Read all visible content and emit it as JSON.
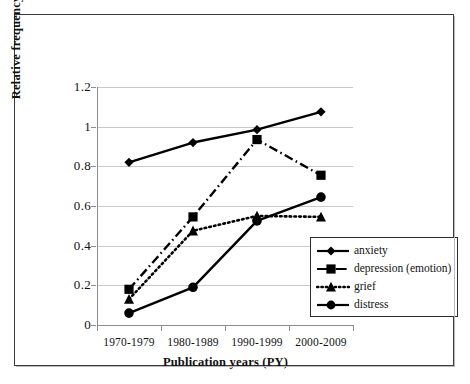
{
  "chart_data": {
    "type": "line",
    "title": "",
    "xlabel": "Publication years (PY)",
    "ylabel": "Relative frequency (%)",
    "categories": [
      "1970-1979",
      "1980-1989",
      "1990-1999",
      "2000-2009"
    ],
    "ylim": [
      0,
      1.2
    ],
    "ytick_labels": [
      "0",
      "0.2",
      "0.4",
      "0.6",
      "0.8",
      "1",
      "1.2"
    ],
    "ytick_values": [
      0,
      0.2,
      0.4,
      0.6,
      0.8,
      1,
      1.2
    ],
    "grid": "horizontal",
    "legend_position": "inside lower-right",
    "series": [
      {
        "name": "anxiety",
        "marker": "diamond",
        "line_style": "solid",
        "color": "#000000",
        "values": [
          0.82,
          0.92,
          0.985,
          1.075
        ]
      },
      {
        "name": "depression (emotion)",
        "marker": "square",
        "line_style": "dash-dot",
        "color": "#000000",
        "values": [
          0.18,
          0.545,
          0.935,
          0.755
        ]
      },
      {
        "name": "grief",
        "marker": "triangle",
        "line_style": "dotted",
        "color": "#000000",
        "values": [
          0.13,
          0.475,
          0.55,
          0.545
        ]
      },
      {
        "name": "distress",
        "marker": "circle",
        "line_style": "solid",
        "color": "#000000",
        "values": [
          0.06,
          0.19,
          0.525,
          0.645
        ]
      }
    ]
  },
  "legend": {
    "items": [
      {
        "label": "anxiety"
      },
      {
        "label": "depression (emotion)"
      },
      {
        "label": "grief"
      },
      {
        "label": "distress"
      }
    ]
  },
  "style": {
    "background": "#ffffff",
    "axis_color": "#8d8d8d",
    "grid_color": "#c8c8c8",
    "frame_color": "#3a3a40",
    "ink": "#000000"
  }
}
